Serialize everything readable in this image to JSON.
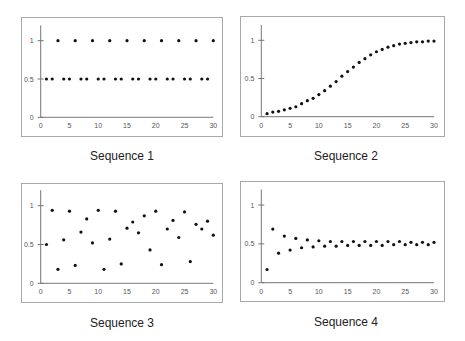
{
  "chart_data": [
    {
      "type": "scatter",
      "title": "Sequence 1",
      "xlabel": "",
      "ylabel": "",
      "xlim": [
        0,
        30
      ],
      "ylim": [
        0,
        1.2
      ],
      "x_ticks": [
        "0",
        "5",
        "10",
        "15",
        "20",
        "25",
        "30"
      ],
      "y_ticks": [
        "0",
        "0.5",
        "1"
      ],
      "grid": false,
      "x": [
        1,
        2,
        3,
        4,
        5,
        6,
        7,
        8,
        9,
        10,
        11,
        12,
        13,
        14,
        15,
        16,
        17,
        18,
        19,
        20,
        21,
        22,
        23,
        24,
        25,
        26,
        27,
        28,
        29,
        30
      ],
      "values": [
        0.5,
        0.5,
        1,
        0.5,
        0.5,
        1,
        0.5,
        0.5,
        1,
        0.5,
        0.5,
        1,
        0.5,
        0.5,
        1,
        0.5,
        0.5,
        1,
        0.5,
        0.5,
        1,
        0.5,
        0.5,
        1,
        0.5,
        0.5,
        1,
        0.5,
        0.5,
        1
      ]
    },
    {
      "type": "scatter",
      "title": "Sequence 2",
      "xlabel": "",
      "ylabel": "",
      "xlim": [
        0,
        30
      ],
      "ylim": [
        0,
        1.2
      ],
      "x_ticks": [
        "0",
        "5",
        "10",
        "15",
        "20",
        "25",
        "30"
      ],
      "y_ticks": [
        "0",
        "0.5",
        "1"
      ],
      "grid": false,
      "x": [
        1,
        2,
        3,
        4,
        5,
        6,
        7,
        8,
        9,
        10,
        11,
        12,
        13,
        14,
        15,
        16,
        17,
        18,
        19,
        20,
        21,
        22,
        23,
        24,
        25,
        26,
        27,
        28,
        29,
        30
      ],
      "values": [
        0.04,
        0.06,
        0.07,
        0.09,
        0.11,
        0.13,
        0.17,
        0.21,
        0.24,
        0.29,
        0.34,
        0.4,
        0.46,
        0.53,
        0.59,
        0.65,
        0.71,
        0.76,
        0.81,
        0.85,
        0.88,
        0.91,
        0.93,
        0.95,
        0.96,
        0.97,
        0.98,
        0.98,
        0.99,
        0.99
      ]
    },
    {
      "type": "scatter",
      "title": "Sequence 3",
      "xlabel": "",
      "ylabel": "",
      "xlim": [
        0,
        30
      ],
      "ylim": [
        0,
        1.2
      ],
      "x_ticks": [
        "0",
        "5",
        "10",
        "15",
        "20",
        "25",
        "30"
      ],
      "y_ticks": [
        "0",
        "0.5",
        "1"
      ],
      "grid": false,
      "x": [
        1,
        2,
        3,
        4,
        5,
        6,
        7,
        8,
        9,
        10,
        11,
        12,
        13,
        14,
        15,
        16,
        17,
        18,
        19,
        20,
        21,
        22,
        23,
        24,
        25,
        26,
        27,
        28,
        29,
        30
      ],
      "values": [
        0.5,
        0.94,
        0.18,
        0.56,
        0.93,
        0.23,
        0.66,
        0.83,
        0.52,
        0.94,
        0.18,
        0.57,
        0.93,
        0.25,
        0.71,
        0.79,
        0.65,
        0.87,
        0.43,
        0.93,
        0.24,
        0.7,
        0.81,
        0.59,
        0.92,
        0.28,
        0.76,
        0.7,
        0.8,
        0.62
      ]
    },
    {
      "type": "scatter",
      "title": "Sequence 4",
      "xlabel": "",
      "ylabel": "",
      "xlim": [
        0,
        30
      ],
      "ylim": [
        0,
        1.2
      ],
      "x_ticks": [
        "0",
        "5",
        "10",
        "15",
        "20",
        "25",
        "30"
      ],
      "y_ticks": [
        "0",
        "0.5",
        "1"
      ],
      "grid": false,
      "x": [
        1,
        2,
        3,
        4,
        5,
        6,
        7,
        8,
        9,
        10,
        11,
        12,
        13,
        14,
        15,
        16,
        17,
        18,
        19,
        20,
        21,
        22,
        23,
        24,
        25,
        26,
        27,
        28,
        29,
        30
      ],
      "values": [
        0.17,
        0.69,
        0.38,
        0.6,
        0.42,
        0.57,
        0.45,
        0.55,
        0.46,
        0.54,
        0.47,
        0.53,
        0.47,
        0.53,
        0.48,
        0.53,
        0.48,
        0.53,
        0.48,
        0.53,
        0.48,
        0.53,
        0.49,
        0.53,
        0.49,
        0.52,
        0.49,
        0.52,
        0.49,
        0.52
      ]
    }
  ],
  "panels": [
    {
      "caption": "Sequence 1"
    },
    {
      "caption": "Sequence 2"
    },
    {
      "caption": "Sequence 3"
    },
    {
      "caption": "Sequence 4"
    }
  ],
  "style": {
    "dot_color": "#111111",
    "axis_color": "#777777",
    "frame_color": "#a8a8a8"
  }
}
